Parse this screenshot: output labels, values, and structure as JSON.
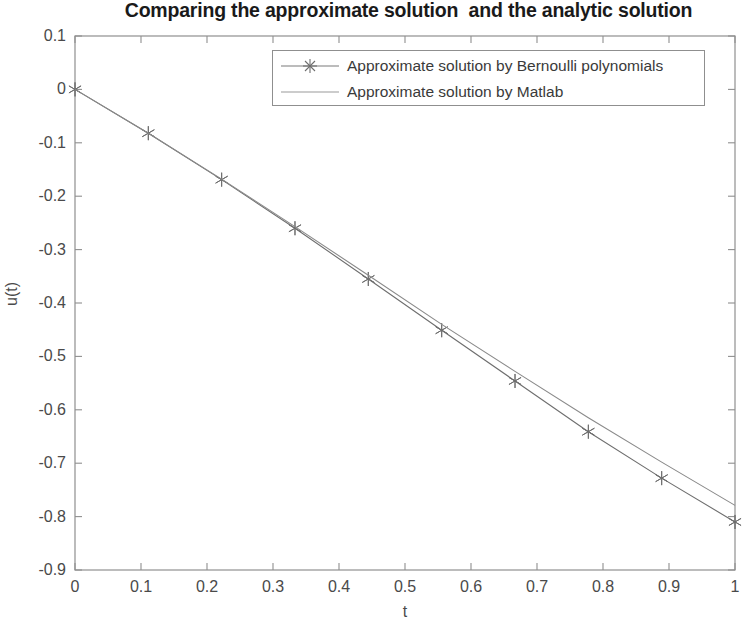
{
  "chart_data": {
    "type": "line",
    "title": "Comparing the approximate solution  and the analytic solution",
    "xlabel": "t",
    "ylabel": "u(t)",
    "xlim": [
      0,
      1
    ],
    "ylim": [
      -0.9,
      0.1
    ],
    "xticks": [
      "0",
      "0.1",
      "0.2",
      "0.3",
      "0.4",
      "0.5",
      "0.6",
      "0.7",
      "0.8",
      "0.9",
      "1"
    ],
    "xtick_values": [
      0,
      0.1,
      0.2,
      0.3,
      0.4,
      0.5,
      0.6,
      0.7,
      0.8,
      0.9,
      1
    ],
    "yticks": [
      "0.1",
      "0",
      "-0.1",
      "-0.2",
      "-0.3",
      "-0.4",
      "-0.5",
      "-0.6",
      "-0.7",
      "-0.8",
      "-0.9"
    ],
    "ytick_values": [
      0.1,
      0,
      -0.1,
      -0.2,
      -0.3,
      -0.4,
      -0.5,
      -0.6,
      -0.7,
      -0.8,
      -0.9
    ],
    "grid": false,
    "legend_position": "top-right-inside",
    "series": [
      {
        "name": "Approximate solution by Bernoulli polynomials",
        "marker": "star",
        "color": "#6e6e6e",
        "x": [
          0,
          0.1111,
          0.2222,
          0.3333,
          0.4444,
          0.5556,
          0.6667,
          0.7778,
          0.8889,
          1
        ],
        "values": [
          0,
          -0.082,
          -0.169,
          -0.26,
          -0.355,
          -0.451,
          -0.546,
          -0.641,
          -0.728,
          -0.81
        ]
      },
      {
        "name": "Approximate solution by Matlab",
        "marker": "none",
        "color": "#8a8a8a",
        "x": [
          0,
          0.1111,
          0.2222,
          0.3333,
          0.4444,
          0.5556,
          0.6667,
          0.7778,
          0.8889,
          1
        ],
        "values": [
          0,
          -0.082,
          -0.168,
          -0.257,
          -0.348,
          -0.44,
          -0.528,
          -0.615,
          -0.698,
          -0.779
        ]
      }
    ]
  },
  "legend": {
    "entries": [
      {
        "label": "Approximate solution by Bernoulli polynomials"
      },
      {
        "label": "Approximate solution by Matlab"
      }
    ]
  }
}
